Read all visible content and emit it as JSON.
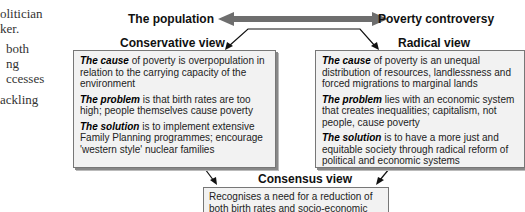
{
  "left_column": {
    "lines": [
      [
        "olitician",
        "ker."
      ],
      [
        "both",
        "ng",
        "ccesses"
      ],
      [
        "ackling"
      ]
    ]
  },
  "header": {
    "left_label": "The population",
    "right_label": "Poverty controversy"
  },
  "conservative": {
    "title": "Conservative view",
    "cause_label": "The cause",
    "cause_text": " of poverty is overpopulation in relation to the carrying capacity of the environment",
    "problem_label": "The problem",
    "problem_text": " is that birth rates are too high; people themselves cause poverty",
    "solution_label": "The solution",
    "solution_text": " is to implement extensive Family Planning programmes; encourage 'western style' nuclear families"
  },
  "radical": {
    "title": "Radical view",
    "cause_label": "The cause",
    "cause_text": " of poverty is an unequal distribution of resources, landlessness and forced migrations to marginal lands",
    "problem_label": "The problem",
    "problem_text": " lies with an economic system that creates inequalities; capitalism, not people, cause poverty",
    "solution_label": "The solution",
    "solution_text": " is to have a more just and equitable society through radical reform of political and economic systems"
  },
  "consensus": {
    "title": "Consensus view",
    "text": "Recognises a need for a reduction of both birth rates and socio-economic qualities"
  },
  "colors": {
    "box_fill": "#f2f2f2",
    "arrow_gray": "#707070",
    "border": "#777777"
  }
}
